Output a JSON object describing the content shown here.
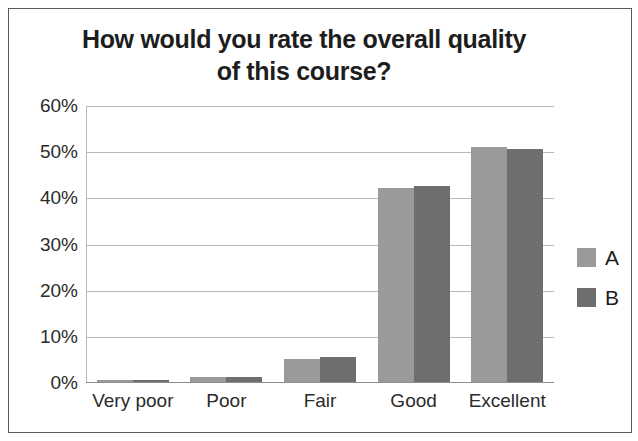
{
  "chart_data": {
    "type": "bar",
    "title": "How would you rate the overall quality of this course?",
    "title_line1": "How would you rate the overall quality",
    "title_line2": "of this course?",
    "xlabel": "",
    "ylabel": "",
    "categories": [
      "Very poor",
      "Poor",
      "Fair",
      "Good",
      "Excellent"
    ],
    "series": [
      {
        "name": "A",
        "color": "#9a9a9a",
        "values": [
          0.5,
          1,
          5,
          42,
          51
        ]
      },
      {
        "name": "B",
        "color": "#6e6e6e",
        "values": [
          0.5,
          1,
          5.5,
          42.5,
          50.5
        ]
      }
    ],
    "ylim": [
      0,
      60
    ],
    "yticks": [
      0,
      10,
      20,
      30,
      40,
      50,
      60
    ],
    "ytick_labels": [
      "0%",
      "10%",
      "20%",
      "30%",
      "40%",
      "50%",
      "60%"
    ],
    "grid": true,
    "grid_axis": "y",
    "legend_position": "right",
    "legend_entries": [
      "A",
      "B"
    ],
    "background_color": "#ffffff",
    "border_color": "#5a5a5a",
    "gridline_color": "#b9b9b9"
  }
}
